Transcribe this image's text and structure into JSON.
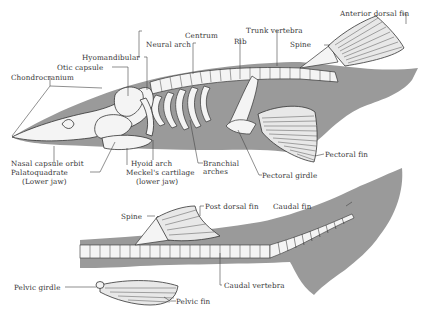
{
  "diagram": {
    "title": "",
    "colors": {
      "body": "#9a9a9a",
      "cartilage": "#f4f4f4",
      "outline": "#333333",
      "leader": "#444444"
    },
    "labels": {
      "anterior_dorsal_fin": "Anterior dorsal fin",
      "centrum": "Centrum",
      "rib": "Rib",
      "trunk_vertebra": "Trunk vertebra",
      "neural_arch": "Neural arch",
      "spine_upper": "Spine",
      "hyomandibular": "Hyomandibular",
      "otic_capsule": "Otic capsule",
      "chondrocranium": "Chondrocranium",
      "nasal_capsule_orbit": "Nasal capsule orbit",
      "palatoquadrate_1": "Palatoquadrate",
      "palatoquadrate_2": "(Lower jaw)",
      "hyoid_arch": "Hyoid arch",
      "meckels_1": "Meckel's cartilage",
      "meckels_2": "(lower jaw)",
      "branchial_1": "Branchial",
      "branchial_2": "arches",
      "pectoral_girdle": "Pectoral girdle",
      "pectoral_fin": "Pectoral fin",
      "spine_lower": "Spine",
      "post_dorsal_fin": "Post dorsal fin",
      "caudal_fin": "Caudal fin",
      "pelvic_girdle": "Pelvic girdle",
      "pelvic_fin": "Pelvic fin",
      "caudal_vertebra": "Caudal vertebra"
    }
  }
}
